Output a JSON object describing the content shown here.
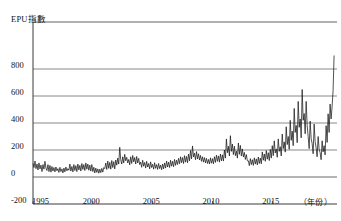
{
  "chart_data": {
    "type": "line",
    "title": "EPU指數",
    "xlabel": "（年份）",
    "ylabel": "EPU指數",
    "grid": true,
    "legend": null,
    "xlim": [
      1995.0,
      2020.4
    ],
    "ylim": [
      -200,
      940
    ],
    "ytick_labels": [
      "800",
      "600",
      "400",
      "200",
      "0",
      "-200"
    ],
    "ytick_values": [
      800,
      600,
      400,
      200,
      0,
      -200
    ],
    "gridline_values": [
      800,
      600,
      400,
      200,
      0
    ],
    "xtick_labels": [
      "1995",
      "2000",
      "2005",
      "2010",
      "2015"
    ],
    "xtick_values": [
      1995,
      2000,
      2005,
      2010,
      2015
    ],
    "series": [
      {
        "name": "EPU指數",
        "color": "#1a1a1a",
        "x_start": 1995.0,
        "x_step": 0.0833,
        "values": [
          100,
          70,
          118,
          62,
          96,
          52,
          104,
          60,
          88,
          40,
          92,
          58,
          116,
          66,
          48,
          92,
          40,
          86,
          36,
          78,
          44,
          70,
          38,
          74,
          46,
          62,
          34,
          72,
          40,
          60,
          30,
          66,
          38,
          74,
          46,
          62,
          50,
          96,
          44,
          78,
          38,
          92,
          48,
          84,
          40,
          96,
          52,
          86,
          44,
          100,
          56,
          92,
          48,
          104,
          58,
          96,
          50,
          88,
          44,
          92,
          40,
          72,
          30,
          66,
          34,
          60,
          28,
          58,
          32,
          64,
          36,
          70,
          62,
          104,
          56,
          118,
          64,
          108,
          58,
          122,
          70,
          114,
          60,
          126,
          88,
          140,
          96,
          220,
          128,
          96,
          150,
          104,
          168,
          120,
          146,
          104,
          130,
          90,
          150,
          100,
          160,
          112,
          144,
          96,
          152,
          104,
          138,
          92,
          110,
          72,
          124,
          80,
          108,
          66,
          116,
          74,
          100,
          60,
          112,
          70,
          94,
          58,
          106,
          64,
          92,
          56,
          100,
          62,
          88,
          54,
          96,
          60,
          104,
          66,
          118,
          74,
          110,
          70,
          124,
          80,
          116,
          76,
          130,
          86,
          124,
          92,
          138,
          98,
          150,
          106,
          144,
          100,
          158,
          110,
          152,
          106,
          170,
          120,
          196,
          134,
          230,
          148,
          176,
          128,
          188,
          134,
          172,
          126,
          160,
          116,
          150,
          110,
          144,
          104,
          138,
          100,
          130,
          96,
          142,
          102,
          136,
          98,
          150,
          108,
          162,
          116,
          156,
          110,
          170,
          120,
          164,
          118,
          200,
          140,
          282,
          180,
          228,
          156,
          306,
          190,
          244,
          166,
          228,
          158,
          192,
          140,
          252,
          168,
          234,
          156,
          208,
          148,
          182,
          130,
          166,
          120,
          120,
          84,
          136,
          92,
          128,
          86,
          142,
          96,
          134,
          90,
          148,
          100,
          140,
          98,
          186,
          124,
          170,
          116,
          196,
          132,
          180,
          122,
          204,
          140,
          232,
          158,
          268,
          178,
          208,
          146,
          282,
          190,
          224,
          156,
          318,
          210,
          260,
          184,
          372,
          240,
          300,
          205,
          420,
          272,
          340,
          232,
          508,
          330,
          382,
          254,
          560,
          368,
          430,
          290,
          648,
          420,
          470,
          320,
          560,
          382,
          300,
          210,
          414,
          284,
          248,
          172,
          392,
          262,
          216,
          150,
          300,
          204,
          180,
          128,
          268,
          186,
          232,
          164,
          380,
          256,
          468,
          330,
          540,
          430,
          520,
          640,
          900
        ]
      }
    ]
  },
  "plot": {
    "left_px": 33,
    "right_px": 337,
    "top_px": 40,
    "zero_px": 177,
    "bottom_px": 204,
    "grid_color": "#6b6b6b",
    "axis_color": "#3a3a3a",
    "line_color": "#1a1a1a",
    "background": "#ffffff"
  }
}
